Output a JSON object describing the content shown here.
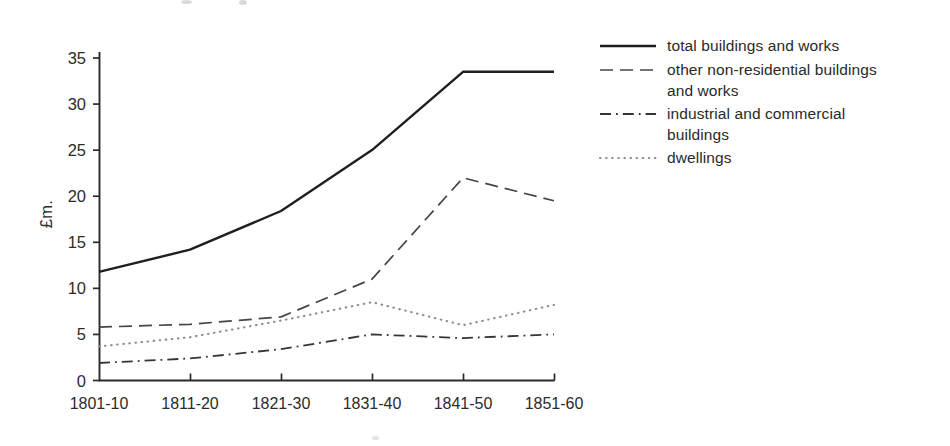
{
  "figure": {
    "ylabel": "£m.",
    "y_ticks": [
      "0",
      "5",
      "10",
      "15",
      "20",
      "25",
      "30",
      "35"
    ],
    "x_labels": [
      "1801-10",
      "1811-20",
      "1821-30",
      "1831-40",
      "1841-50",
      "1851-60"
    ],
    "axis_color": "#2a2a2a"
  },
  "chart_data": {
    "type": "line",
    "title": "",
    "xlabel": "",
    "ylabel": "£m.",
    "categories": [
      "1801-10",
      "1811-20",
      "1821-30",
      "1831-40",
      "1841-50",
      "1851-60"
    ],
    "ylim": [
      0,
      35
    ],
    "y_tick_step": 5,
    "grid": false,
    "legend_position": "right",
    "series": [
      {
        "name": "total buildings and works",
        "style": "solid",
        "color": "#1f1f1f",
        "values": [
          11.8,
          14.2,
          18.4,
          25.0,
          33.5,
          33.5
        ]
      },
      {
        "name": "other non-residential buildings and works",
        "style": "dashed",
        "color": "#454545",
        "values": [
          5.8,
          6.1,
          6.9,
          11.0,
          22.0,
          19.5
        ]
      },
      {
        "name": "industrial and commercial buildings",
        "style": "dashdot",
        "color": "#353535",
        "values": [
          1.9,
          2.4,
          3.4,
          5.0,
          4.6,
          5.0
        ]
      },
      {
        "name": "dwellings",
        "style": "dotted",
        "color": "#8c8c8c",
        "values": [
          3.7,
          4.7,
          6.5,
          8.5,
          6.0,
          8.2
        ]
      }
    ]
  }
}
